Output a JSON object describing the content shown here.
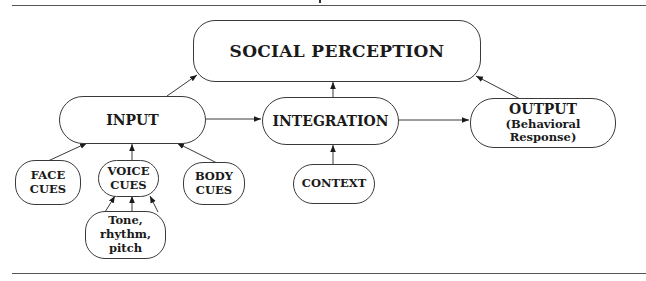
{
  "diagram": {
    "title_node": {
      "label": "SOCIAL PERCEPTION"
    },
    "input": {
      "label": "INPUT"
    },
    "integration": {
      "label": "INTEGRATION"
    },
    "output": {
      "label": "OUTPUT",
      "sublabel": "(Behavioral Response)"
    },
    "face_cues": {
      "line1": "FACE",
      "line2": "CUES"
    },
    "voice_cues": {
      "line1": "VOICE",
      "line2": "CUES"
    },
    "body_cues": {
      "line1": "BODY",
      "line2": "CUES"
    },
    "context": {
      "label": "CONTEXT"
    },
    "voice_features": {
      "line1": "Tone, rhythm,",
      "line2": "pitch"
    },
    "edges": [
      {
        "from": "INPUT",
        "to": "SOCIAL PERCEPTION"
      },
      {
        "from": "INTEGRATION",
        "to": "SOCIAL PERCEPTION"
      },
      {
        "from": "OUTPUT",
        "to": "SOCIAL PERCEPTION"
      },
      {
        "from": "INPUT",
        "to": "INTEGRATION"
      },
      {
        "from": "INTEGRATION",
        "to": "OUTPUT"
      },
      {
        "from": "FACE CUES",
        "to": "INPUT"
      },
      {
        "from": "VOICE CUES",
        "to": "INPUT"
      },
      {
        "from": "BODY CUES",
        "to": "INPUT"
      },
      {
        "from": "CONTEXT",
        "to": "INTEGRATION"
      },
      {
        "from": "Tone, rhythm, pitch",
        "to": "VOICE CUES",
        "count": 3
      }
    ],
    "colors": {
      "stroke": "#3a3a3a",
      "text": "#1a1a1a",
      "background": "#ffffff"
    }
  }
}
